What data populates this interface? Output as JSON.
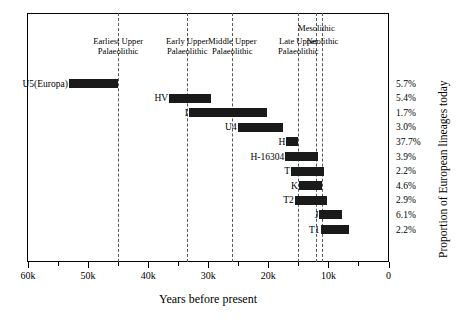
{
  "chart_data": {
    "type": "bar",
    "orientation": "horizontal-range",
    "title": "",
    "xlabel": "Years before present",
    "ylabel_right": "Proportion of European lineages today",
    "xlim": [
      60000,
      0
    ],
    "x_inverted": true,
    "grid": "vertical dashed at period boundaries",
    "legend": "none",
    "x_major_ticks": [
      {
        "value": 60000,
        "label": "60k"
      },
      {
        "value": 50000,
        "label": "50k"
      },
      {
        "value": 40000,
        "label": "40k"
      },
      {
        "value": 30000,
        "label": "30k"
      },
      {
        "value": 20000,
        "label": "20k"
      },
      {
        "value": 10000,
        "label": "10k"
      },
      {
        "value": 0,
        "label": "0"
      }
    ],
    "x_minor_ticks": [
      55000,
      45000,
      35000,
      25000,
      15000,
      5000
    ],
    "period_markers": [
      {
        "label_line1": "Earliest Upper",
        "label_line2": "Palaeolithic",
        "value": 45000,
        "label_top": 37,
        "raised": false
      },
      {
        "label_line1": "Early Upper",
        "label_line2": "Palaeolithic",
        "value": 33500,
        "label_top": 37,
        "raised": false
      },
      {
        "label_line1": "Middle Upper",
        "label_line2": "Palaeolithic",
        "value": 26000,
        "label_top": 37,
        "raised": false
      },
      {
        "label_line1": "Late Upper",
        "label_line2": "Palaeolithic",
        "value": 15000,
        "label_top": 37,
        "raised": false
      },
      {
        "label_line1": "Mesolithic",
        "label_line2": "",
        "value": 12000,
        "label_top": 24,
        "raised": true
      },
      {
        "label_line1": "Neolithic",
        "label_line2": "",
        "value": 11000,
        "label_top": 37,
        "raised": false
      }
    ],
    "categories": [
      "U5(Europa)",
      "HV",
      "I",
      "U4",
      "H",
      "H-16304",
      "T",
      "K",
      "T2",
      "J",
      "T1"
    ],
    "bars": [
      {
        "name": "U5(Europa)",
        "start": 53200,
        "end": 45000,
        "percent": "5.7%"
      },
      {
        "name": "HV",
        "start": 36500,
        "end": 29500,
        "percent": "5.4%"
      },
      {
        "name": "I",
        "start": 33200,
        "end": 20200,
        "percent": "1.7%"
      },
      {
        "name": "U4",
        "start": 25100,
        "end": 17500,
        "percent": "3.0%"
      },
      {
        "name": "H",
        "start": 17000,
        "end": 15100,
        "percent": "37.7%"
      },
      {
        "name": "H-16304",
        "start": 17200,
        "end": 11700,
        "percent": "3.9%"
      },
      {
        "name": "T",
        "start": 16200,
        "end": 10800,
        "percent": "2.2%"
      },
      {
        "name": "K",
        "start": 14900,
        "end": 11100,
        "percent": "4.6%"
      },
      {
        "name": "T2",
        "start": 15600,
        "end": 10300,
        "percent": "2.9%"
      },
      {
        "name": "J",
        "start": 11500,
        "end": 7700,
        "percent": "6.1%"
      },
      {
        "name": "T1",
        "start": 11300,
        "end": 6500,
        "percent": "2.2%"
      }
    ],
    "percent_values": [
      "5.7%",
      "5.4%",
      "1.7%",
      "3.0%",
      "37.7%",
      "3.9%",
      "2.2%",
      "4.6%",
      "2.9%",
      "6.1%",
      "2.2%"
    ]
  }
}
